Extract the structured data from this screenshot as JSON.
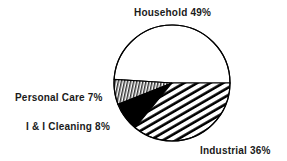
{
  "chart_data": {
    "type": "pie",
    "title": "",
    "categories": [
      "Household",
      "Personal Care",
      "I & I Cleaning",
      "Industrial"
    ],
    "values": [
      49,
      7,
      8,
      36
    ],
    "unit": "%",
    "labels": [
      {
        "name": "Household",
        "value": "49%",
        "text": "Household 49%",
        "fill": "white"
      },
      {
        "name": "Personal Care",
        "value": "7%",
        "text": "Personal Care 7%",
        "fill": "vertical-hatch"
      },
      {
        "name": "I & I Cleaning",
        "value": "8%",
        "text": "I & I Cleaning 8%",
        "fill": "solid-black"
      },
      {
        "name": "Industrial",
        "value": "36%",
        "text": "Industrial 36%",
        "fill": "diagonal-hatch"
      }
    ],
    "legend": "none (direct labels)",
    "colors": {
      "stroke": "#000000",
      "background": "#ffffff",
      "black_fill": "#000000"
    }
  },
  "labels": {
    "household": "Household  49%",
    "personal_care": "Personal Care 7%",
    "ii_cleaning": "I & I Cleaning 8%",
    "industrial": "Industrial  36%"
  }
}
